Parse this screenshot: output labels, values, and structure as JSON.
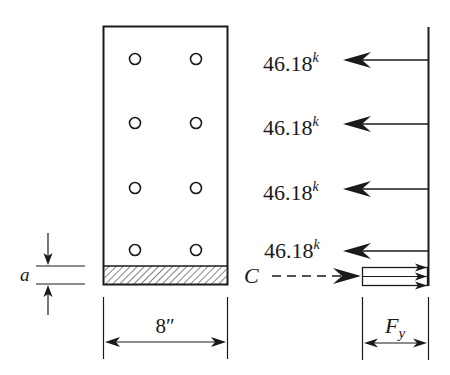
{
  "diagram": {
    "section": {
      "width_label": "8″",
      "depth_label": "a",
      "bolt_rows": 4,
      "bolt_columns": 2
    },
    "forces": [
      {
        "value": "46.18",
        "unit": "k"
      },
      {
        "value": "46.18",
        "unit": "k"
      },
      {
        "value": "46.18",
        "unit": "k"
      },
      {
        "value": "46.18",
        "unit": "k"
      }
    ],
    "compression": {
      "label": "C"
    },
    "stress_block": {
      "label_main": "F",
      "label_sub": "y"
    },
    "colors": {
      "line": "#1a1a1a",
      "background": "#ffffff"
    }
  }
}
